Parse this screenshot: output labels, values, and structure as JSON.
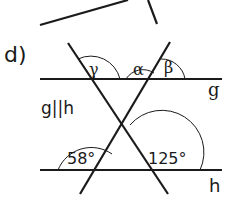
{
  "part_label": "d)",
  "lines": {
    "g": "g",
    "h": "h"
  },
  "parallel_note": "g||h",
  "angles": {
    "gamma": "γ",
    "alpha": "α",
    "beta": "β",
    "left_bottom": "58°",
    "right_bottom": "125°"
  },
  "colors": {
    "stroke": "#1a1a1a",
    "background": "#ffffff"
  }
}
